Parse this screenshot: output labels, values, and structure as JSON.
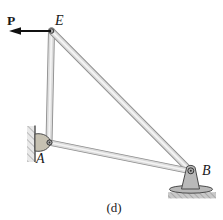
{
  "figure": {
    "caption": "(d)",
    "labels": {
      "force": "P",
      "node_e": "E",
      "node_a": "A",
      "node_b": "B"
    },
    "structure": {
      "nodes": [
        "E",
        "A",
        "B"
      ],
      "members": [
        "EA",
        "EB",
        "AB"
      ],
      "force": {
        "label": "P",
        "applied_at": "E",
        "direction": "left"
      },
      "supports": [
        {
          "at": "A",
          "type": "pin-on-wall"
        },
        {
          "at": "B",
          "type": "pin-on-ground"
        }
      ]
    }
  },
  "colors": {
    "background": "#ffffff",
    "member_edge": "#8f8f8f",
    "member_fill": "#dcdcdc",
    "member_highlight": "#f4f4f4",
    "bracket_fill": "#c6c1b2",
    "support_fill": "#b9b9b9",
    "pin_fill": "#a9a9a9",
    "pin_stroke": "#333333",
    "hatch_bg": "#e9e9e9",
    "hatch_line": "#8a8a8a",
    "ground_bg": "#c9c9c9",
    "outline": "#4a4a4a",
    "arrow": "#111111",
    "text": "#1a1a1a"
  }
}
